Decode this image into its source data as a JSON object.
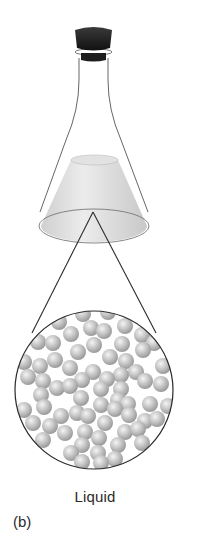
{
  "figure": {
    "state_label": "Liquid",
    "panel_label": "(b)",
    "elements": {
      "flask": "erlenmeyer-flask-icon",
      "stopper": "stopper-icon",
      "liquid": "liquid-fill",
      "magnifier": "magnified-view-circle",
      "particles": "liquid-particles"
    },
    "colors": {
      "stopper": "#1a1a1a",
      "glass_outline": "#555555",
      "liquid": "#d9d9d9",
      "particle": "#bdbdbd",
      "zoom_lines": "#2b2b2b"
    }
  }
}
